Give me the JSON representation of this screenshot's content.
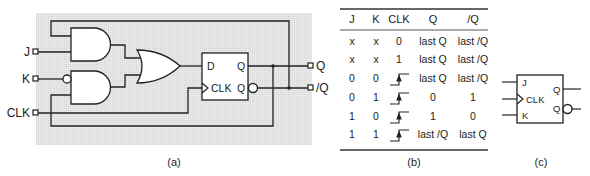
{
  "figure_a": {
    "caption": "(a)",
    "inputs": {
      "j": "J",
      "k": "K",
      "clk": "CLK"
    },
    "outputs": {
      "q": "Q",
      "qbar": "/Q"
    },
    "flipflop": {
      "d": "D",
      "clk": "CLK",
      "q": "Q",
      "qbar": "Q"
    },
    "background_color": "#e6e6e6"
  },
  "figure_b": {
    "caption": "(b)",
    "headers": [
      "J",
      "K",
      "CLK",
      "Q",
      "/Q"
    ],
    "rows": [
      {
        "j": "x",
        "k": "x",
        "clk": "0",
        "q": "last Q",
        "qbar": "last /Q"
      },
      {
        "j": "x",
        "k": "x",
        "clk": "1",
        "q": "last Q",
        "qbar": "last /Q"
      },
      {
        "j": "0",
        "k": "0",
        "clk": "rising-edge",
        "q": "last Q",
        "qbar": "last /Q"
      },
      {
        "j": "0",
        "k": "1",
        "clk": "rising-edge",
        "q": "0",
        "qbar": "1"
      },
      {
        "j": "1",
        "k": "0",
        "clk": "rising-edge",
        "q": "1",
        "qbar": "0"
      },
      {
        "j": "1",
        "k": "1",
        "clk": "rising-edge",
        "q": "last /Q",
        "qbar": "last Q"
      }
    ]
  },
  "figure_c": {
    "caption": "(c)",
    "labels": {
      "j": "J",
      "clk": "CLK",
      "k": "K",
      "q": "Q",
      "qbar": "Q"
    }
  }
}
